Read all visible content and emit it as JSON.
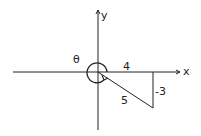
{
  "diagram": {
    "axes": {
      "x_label": "x",
      "y_label": "y"
    },
    "angle_label": "θ",
    "point": {
      "x": 4,
      "y": -3
    },
    "labels": {
      "adjacent": "4",
      "opposite": "-3",
      "hypotenuse": "5"
    },
    "colors": {
      "stroke": "#222222",
      "background": "#ffffff"
    }
  }
}
